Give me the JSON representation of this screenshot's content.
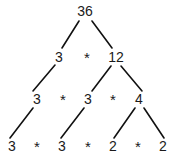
{
  "diagram": {
    "type": "factor-tree",
    "colors": {
      "background": "#ffffff",
      "text": "#1a1a1a",
      "edge": "#111111"
    },
    "operator_symbol": "*",
    "rows": [
      {
        "id": "row-1",
        "y": 11,
        "cells": [
          {
            "kind": "value",
            "text": "36",
            "x": 85
          }
        ]
      },
      {
        "id": "row-2",
        "y": 57,
        "cells": [
          {
            "kind": "value",
            "text": "3",
            "x": 59
          },
          {
            "kind": "operator",
            "text": "*",
            "x": 87
          },
          {
            "kind": "value",
            "text": "12",
            "x": 116
          }
        ]
      },
      {
        "id": "row-3",
        "y": 99,
        "cells": [
          {
            "kind": "value",
            "text": "3",
            "x": 37
          },
          {
            "kind": "operator",
            "text": "*",
            "x": 63
          },
          {
            "kind": "value",
            "text": "3",
            "x": 88
          },
          {
            "kind": "operator",
            "text": "*",
            "x": 113
          },
          {
            "kind": "value",
            "text": "4",
            "x": 139
          }
        ]
      },
      {
        "id": "row-4",
        "y": 146,
        "cells": [
          {
            "kind": "value",
            "text": "3",
            "x": 12
          },
          {
            "kind": "operator",
            "text": "*",
            "x": 37
          },
          {
            "kind": "value",
            "text": "3",
            "x": 62
          },
          {
            "kind": "operator",
            "text": "*",
            "x": 88
          },
          {
            "kind": "value",
            "text": "2",
            "x": 113
          },
          {
            "kind": "operator",
            "text": "*",
            "x": 138
          },
          {
            "kind": "value",
            "text": "2",
            "x": 163
          }
        ]
      }
    ],
    "edges": [
      {
        "from": "36",
        "to": "3",
        "x1": 79,
        "y1": 21,
        "x2": 62,
        "y2": 48
      },
      {
        "from": "36",
        "to": "12",
        "x1": 92,
        "y1": 21,
        "x2": 112,
        "y2": 48
      },
      {
        "from": "3",
        "to": "3",
        "x1": 55,
        "y1": 65,
        "x2": 33,
        "y2": 91
      },
      {
        "from": "12",
        "to": "3",
        "x1": 111,
        "y1": 66,
        "x2": 92,
        "y2": 91
      },
      {
        "from": "12",
        "to": "4",
        "x1": 121,
        "y1": 66,
        "x2": 142,
        "y2": 91
      },
      {
        "from": "3",
        "to": "3",
        "x1": 33,
        "y1": 108,
        "x2": 10,
        "y2": 138
      },
      {
        "from": "3",
        "to": "3",
        "x1": 84,
        "y1": 108,
        "x2": 61,
        "y2": 138
      },
      {
        "from": "4",
        "to": "2",
        "x1": 135,
        "y1": 108,
        "x2": 114,
        "y2": 138
      },
      {
        "from": "4",
        "to": "2",
        "x1": 144,
        "y1": 108,
        "x2": 164,
        "y2": 138
      }
    ]
  }
}
